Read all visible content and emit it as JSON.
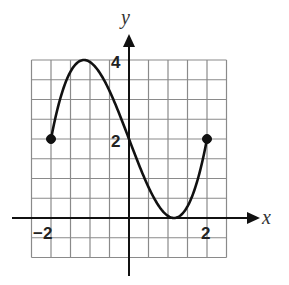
{
  "chart_data": {
    "type": "line",
    "title": "",
    "xlabel": "x",
    "ylabel": "y",
    "xlim": [
      -2.5,
      2.5
    ],
    "ylim": [
      -1,
      4
    ],
    "grid": true,
    "grid_step": 0.5,
    "x_tick_labels": [
      "-2",
      "2"
    ],
    "y_tick_labels": [
      "2",
      "4"
    ],
    "series": [
      {
        "name": "f(x)",
        "x": [
          -2,
          -1.5,
          -1.155,
          -1,
          -0.5,
          0,
          0.5,
          1,
          1.155,
          1.5,
          2
        ],
        "y": [
          2,
          3.71,
          4,
          3.95,
          3.22,
          2,
          0.78,
          0.05,
          0,
          0.29,
          2
        ],
        "endpoints": [
          {
            "x": -2,
            "y": 2,
            "closed": true
          },
          {
            "x": 2,
            "y": 2,
            "closed": true
          }
        ]
      }
    ],
    "annotations": [
      "local maximum near (-1.15, 4)",
      "local minimum near (1.15, 0)",
      "y-intercept (0, 2)"
    ]
  },
  "labels": {
    "x_axis": "x",
    "y_axis": "y",
    "tick_neg2": "−2",
    "tick_pos2": "2",
    "tick_y2": "2",
    "tick_y4": "4"
  }
}
